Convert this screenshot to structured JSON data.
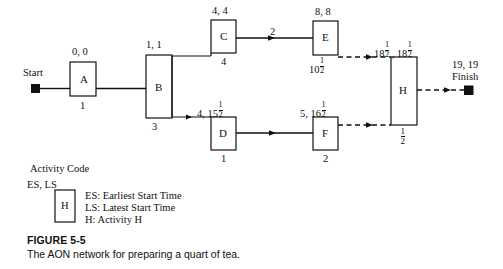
{
  "figure": {
    "caption_title": "FIGURE 5-5",
    "caption_text": "The AON network for preparing a quart of tea.",
    "start_label": "Start",
    "finish_esls": "19, 19",
    "finish_label": "Finish"
  },
  "nodes": {
    "A": {
      "letter": "A",
      "es_ls": "0, 0",
      "duration": "1"
    },
    "B": {
      "letter": "B",
      "es_ls": "1, 1",
      "duration": "3"
    },
    "C": {
      "letter": "C",
      "es_ls": "4, 4",
      "duration": "4"
    },
    "D": {
      "letter": "D",
      "es_ls_prefix": "4, 15",
      "es_ls_frac_num": "1",
      "es_ls_frac_den": "2",
      "duration": "1"
    },
    "E": {
      "letter": "E",
      "es_ls": "8, 8",
      "duration_prefix": "10",
      "duration_frac_num": "1",
      "duration_frac_den": "2"
    },
    "F": {
      "letter": "F",
      "es_ls_prefix": "5, 16",
      "es_ls_frac_num": "1",
      "es_ls_frac_den": "2",
      "duration": "2"
    },
    "H": {
      "letter": "H",
      "es_prefix": "18",
      "es_frac_num": "1",
      "es_frac_den": "2",
      "separator": ",",
      "ls_prefix": "18",
      "ls_frac_num": "1",
      "ls_frac_den": "2",
      "duration_frac_num": "1",
      "duration_frac_den": "2"
    }
  },
  "edge_labels": {
    "c_to_e": "2"
  },
  "legend": {
    "title": "Activity Code",
    "esls_header": "ES, LS",
    "box_letter": "H",
    "line1": "ES: Earliest Start Time",
    "line2": "LS: Latest Start Time",
    "line3": "H:  Activity H"
  },
  "colors": {
    "stroke": "#111111",
    "background": "#ffffff"
  }
}
